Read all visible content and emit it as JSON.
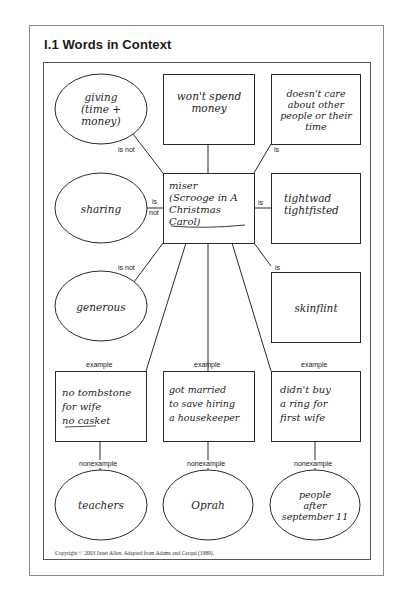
{
  "page": {
    "title": "I.1  Words in Context",
    "copyright": "Copyright © 2003 Janet Allen. Adapted from Adams and Cerqui (1989)."
  },
  "center": {
    "text": "miser\n(Scrooge in A\nChristmas Carol)"
  },
  "nodes": {
    "giving": "giving\n(time +\nmoney)",
    "wont_spend": "won't spend\nmoney",
    "doesnt_care": "doesn't care\nabout other\npeople or their\ntime",
    "sharing": "sharing",
    "tightwad": "tightwad\ntightfisted",
    "generous": "generous",
    "skinflint": "skinflint",
    "example_1": "no tombstone\nfor wife\nno casket",
    "example_2": "got married\nto save hiring\na housekeeper",
    "example_3": "didn't buy\na ring for\nfirst wife",
    "nonexample_1": "teachers",
    "nonexample_2": "Oprah",
    "nonexample_3": "people\nafter\nseptember 11"
  },
  "labels": {
    "giving_rel": "is not",
    "doesnt_care_rel": "is",
    "sharing_rel_1": "is",
    "sharing_rel_2": "not",
    "tightwad_rel": "is",
    "generous_rel": "is not",
    "skinflint_rel": "is",
    "example": "example",
    "nonexample": "nonexample"
  }
}
